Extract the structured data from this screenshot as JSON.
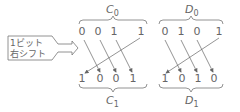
{
  "callout": {
    "line1": "1ビット",
    "line2": "右シフト",
    "icon": "right-arrow-icon"
  },
  "groups": [
    {
      "top_label": "C",
      "top_sub": "0",
      "bottom_label": "C",
      "bottom_sub": "1",
      "top_bits": [
        "0",
        "0",
        "1",
        "1"
      ],
      "bottom_bits": [
        "1",
        "0",
        "0",
        "1"
      ]
    },
    {
      "top_label": "D",
      "top_sub": "0",
      "bottom_label": "D",
      "bottom_sub": "1",
      "top_bits": [
        "0",
        "1",
        "0",
        "1"
      ],
      "bottom_bits": [
        "1",
        "0",
        "1",
        "0"
      ]
    }
  ],
  "colors": {
    "line": "#777777",
    "text": "#666666"
  }
}
